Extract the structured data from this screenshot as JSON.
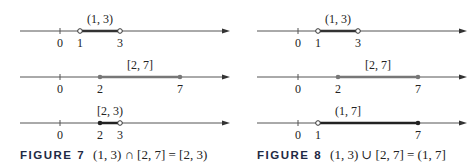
{
  "figures": [
    {
      "id": "figure-7",
      "caption_label": "FIGURE 7",
      "caption_text": "(1, 3) ∩ [2, 7] = [2, 3)",
      "lines": [
        {
          "interval": "(1, 3)",
          "ticks": [
            "0",
            "1",
            "3"
          ]
        },
        {
          "interval": "[2, 7]",
          "ticks": [
            "0",
            "2",
            "7"
          ]
        },
        {
          "interval": "[2, 3)",
          "ticks": [
            "0",
            "2",
            "3"
          ]
        }
      ]
    },
    {
      "id": "figure-8",
      "caption_label": "FIGURE 8",
      "caption_text": "(1, 3) ∪ [2, 7] = (1, 7]",
      "lines": [
        {
          "interval": "(1, 3)",
          "ticks": [
            "0",
            "1",
            "3"
          ]
        },
        {
          "interval": "[2, 7]",
          "ticks": [
            "0",
            "2",
            "7"
          ]
        },
        {
          "interval": "(1, 7]",
          "ticks": [
            "0",
            "1",
            "7"
          ]
        }
      ]
    }
  ],
  "colors": {
    "axis": "#555555",
    "segment_dark": "#333333",
    "segment_gray": "#777777"
  }
}
